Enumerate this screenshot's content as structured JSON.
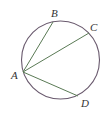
{
  "diagram": {
    "type": "circle-with-chords",
    "circle": {
      "cx": 60.5,
      "cy": 60,
      "r": 39,
      "stroke": "#6a5a6e"
    },
    "chord_color": "#5a7a55",
    "points": [
      {
        "name": "A",
        "x": 23,
        "y": 72,
        "label_x": 11,
        "label_y": 79
      },
      {
        "name": "B",
        "x": 53,
        "y": 22,
        "label_x": 51,
        "label_y": 17
      },
      {
        "name": "C",
        "x": 89,
        "y": 33,
        "label_x": 90,
        "label_y": 31
      },
      {
        "name": "D",
        "x": 78,
        "y": 96,
        "label_x": 81,
        "label_y": 107
      }
    ],
    "chords": [
      {
        "from": "A",
        "to": "B"
      },
      {
        "from": "A",
        "to": "C"
      },
      {
        "from": "A",
        "to": "D"
      }
    ],
    "labels": {
      "A": "A",
      "B": "B",
      "C": "C",
      "D": "D"
    }
  }
}
